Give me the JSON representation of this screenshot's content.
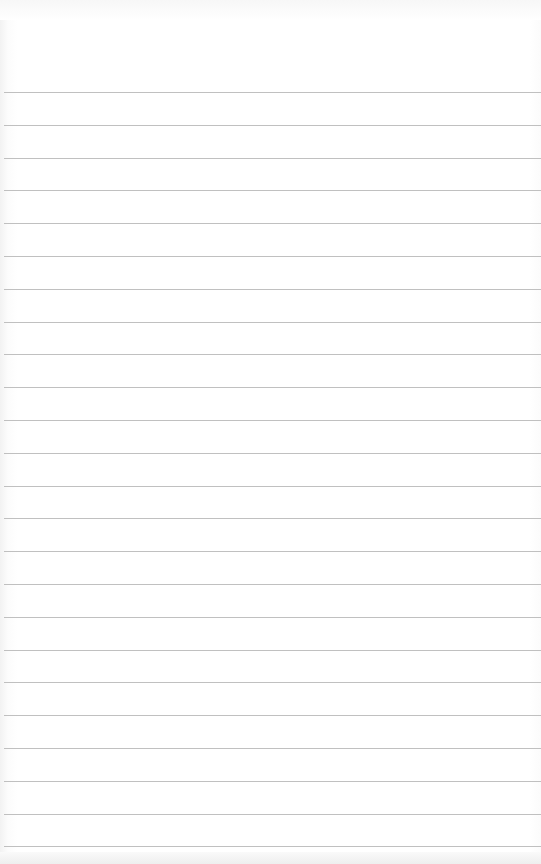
{
  "paper": {
    "type": "lined-notebook-page",
    "background_color": "#ffffff",
    "rule_color": "#b5b5b5",
    "rule_count": 24,
    "first_rule_y": 92,
    "rule_spacing": 32.8
  }
}
